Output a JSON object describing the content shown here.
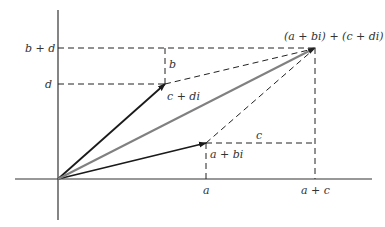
{
  "diagram": {
    "origin": [
      58,
      179
    ],
    "points": {
      "z1": {
        "label": "a + bi",
        "x": 206,
        "y": 143
      },
      "z2": {
        "label": "c + di",
        "x": 165,
        "y": 84
      },
      "sum": {
        "label": "(a + bi) + (c + di)",
        "x": 315,
        "y": 48
      }
    },
    "axis_labels": {
      "x_a": "a",
      "x_a_plus_c": "a + c",
      "y_d": "d",
      "y_b_plus_d": "b + d"
    },
    "segment_labels": {
      "b": "b",
      "c": "c"
    },
    "colors": {
      "axis": "#333333",
      "vector": "#1a1a1a",
      "sum_vector": "#808080",
      "dashed": "#222222"
    }
  }
}
